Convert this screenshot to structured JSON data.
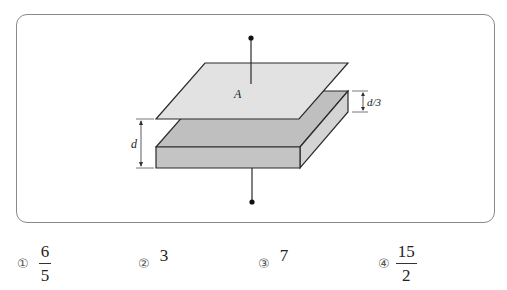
{
  "question": {
    "header_fragment": "",
    "figure": {
      "type": "parallel-plate capacitor with dielectric slab",
      "plate_label": "A",
      "gap_label": "d",
      "slab_offset_label": "d/3",
      "colors": {
        "plate_fill": "#e2e2e2",
        "slab_top_fill": "#bfbfbf",
        "slab_front_fill": "#c4c4c4",
        "slab_side_fill": "#d4d4d4",
        "outline": "#2a2a2a",
        "box_border": "#8a8a8a"
      }
    },
    "choices": [
      {
        "marker": "①",
        "type": "fraction",
        "numerator": "6",
        "denominator": "5"
      },
      {
        "marker": "②",
        "type": "number",
        "value": "3"
      },
      {
        "marker": "③",
        "type": "number",
        "value": "7"
      },
      {
        "marker": "④",
        "type": "fraction",
        "numerator": "15",
        "denominator": "2"
      }
    ]
  }
}
